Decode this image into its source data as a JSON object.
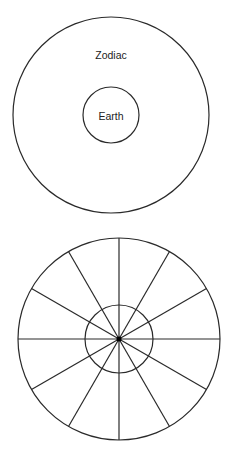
{
  "diagram": {
    "top_figure": {
      "outer_circle": {
        "cx": 111,
        "cy": 115,
        "r": 98,
        "label": "Zodiac",
        "label_x": 111,
        "label_y": 59
      },
      "inner_circle": {
        "cx": 111,
        "cy": 115,
        "r": 28,
        "label": "Earth",
        "label_x": 111,
        "label_y": 120
      }
    },
    "bottom_figure": {
      "outer_circle": {
        "cx": 119,
        "cy": 339,
        "r": 101
      },
      "inner_circle": {
        "cx": 119,
        "cy": 339,
        "r": 34
      },
      "spoke_count": 12,
      "center_dot_r": 2.5
    },
    "colors": {
      "line": "#2a2a2a",
      "text": "#222222",
      "background": "#ffffff"
    }
  }
}
